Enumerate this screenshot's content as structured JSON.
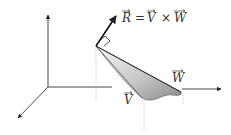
{
  "diagram": {
    "colors": {
      "axis": "#333333",
      "vector": "#111111",
      "guide": "#999999",
      "surface_light": "#f2f2f2",
      "surface_dark": "#8a8a8a"
    },
    "labels": {
      "equation": {
        "lhs": "R",
        "equals": "=",
        "v": "V",
        "times": "×",
        "w": "W"
      },
      "vector_v": "V",
      "vector_w": "W"
    },
    "elements": [
      {
        "id": "axis-z",
        "type": "axis",
        "direction": "up"
      },
      {
        "id": "axis-x",
        "type": "axis",
        "direction": "down-left"
      },
      {
        "id": "axis-y",
        "type": "axis",
        "direction": "right"
      },
      {
        "id": "vector-r",
        "type": "vector",
        "label": "R"
      },
      {
        "id": "vector-v",
        "type": "vector",
        "label": "V"
      },
      {
        "id": "vector-w",
        "type": "vector",
        "label": "W"
      },
      {
        "id": "right-angle-marker",
        "type": "marker"
      },
      {
        "id": "swept-surface",
        "type": "surface"
      }
    ]
  }
}
